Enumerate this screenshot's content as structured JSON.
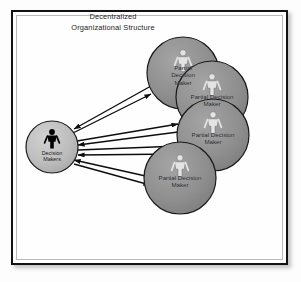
{
  "diagram": {
    "title_line1": "Decentralized",
    "title_line2": "Organizational Structure",
    "colors": {
      "frame_border": "#121212",
      "frame_inner_rule": "#b9b9b9",
      "page_background": "#fdfdfd",
      "node_fill": "#8f8f8f",
      "node_stroke": "#1a1a1a",
      "center_node_fill": "#bdbdbd",
      "person_glyph_light": "#e3e3e3",
      "person_glyph_dark": "#000000",
      "arrow": "#0d0d0d",
      "text": "#232323"
    },
    "center_node": {
      "label_line1": "Decision",
      "label_line2": "Makers",
      "icon": "person-icon",
      "cx": 52,
      "cy": 147,
      "r": 26
    },
    "partial_nodes": [
      {
        "id": "partial-decision-maker-1",
        "label_lines": [
          "Partial",
          "Decision",
          "Maker"
        ],
        "icon": "person-icon",
        "cx": 183,
        "cy": 73,
        "r": 36
      },
      {
        "id": "partial-decision-maker-2",
        "label_lines": [
          "Partial Decision",
          "Maker"
        ],
        "icon": "person-icon",
        "cx": 212,
        "cy": 97,
        "r": 36
      },
      {
        "id": "partial-decision-maker-3",
        "label_lines": [
          "Partial Decision",
          "Maker"
        ],
        "icon": "person-icon",
        "cx": 213,
        "cy": 135,
        "r": 36
      },
      {
        "id": "partial-decision-maker-4",
        "label_lines": [
          "Partial Decision",
          "Maker"
        ],
        "icon": "person-icon",
        "cx": 180,
        "cy": 178,
        "r": 36
      }
    ],
    "connections": [
      {
        "id": "link-center-node1",
        "from": "center_node",
        "to": "partial-decision-maker-1",
        "direction": "bidirectional"
      },
      {
        "id": "link-center-node2",
        "from": "center_node",
        "to": "partial-decision-maker-2",
        "direction": "bidirectional"
      },
      {
        "id": "link-center-node3",
        "from": "center_node",
        "to": "partial-decision-maker-3",
        "direction": "bidirectional"
      },
      {
        "id": "link-center-node4",
        "from": "center_node",
        "to": "partial-decision-maker-4",
        "direction": "bidirectional"
      }
    ]
  }
}
